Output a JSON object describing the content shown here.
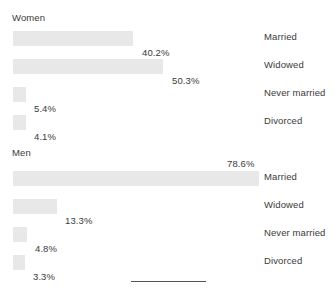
{
  "chart_data": {
    "type": "bar",
    "title": "",
    "xlabel": "",
    "ylabel": "",
    "orientation": "horizontal",
    "value_suffix": "%",
    "grid": false,
    "legend": "none",
    "categories": [
      "Married",
      "Widowed",
      "Never married",
      "Divorced"
    ],
    "panels": [
      {
        "name": "Women",
        "values": [
          40.2,
          50.3,
          5.4,
          4.1
        ],
        "labels": [
          "40.2%",
          "50.3%",
          "5.4%",
          "4.1%"
        ]
      },
      {
        "name": "Men",
        "values": [
          78.6,
          13.3,
          4.8,
          3.3
        ],
        "labels": [
          "78.6%",
          "13.3%",
          "4.8%",
          "3.3%"
        ]
      }
    ],
    "series": [
      {
        "name": "Women",
        "values": [
          40.2,
          50.3,
          5.4,
          4.1
        ]
      },
      {
        "name": "Men",
        "values": [
          78.6,
          13.3,
          4.8,
          3.3
        ]
      }
    ],
    "colors": {
      "bar_fill": "#e8e8e8",
      "text": "#3a3a3a",
      "background": "#ffffff",
      "rule": "#555555"
    }
  },
  "women": {
    "title": "Women",
    "rows": [
      {
        "label": "Married",
        "value": "40.2%",
        "bar_width": 120,
        "label_pos": "below",
        "label_left": 142,
        "row_top": 31
      },
      {
        "label": "Widowed",
        "value": "50.3%",
        "bar_width": 150,
        "label_left": 172,
        "label_pos": "below",
        "row_top": 59
      },
      {
        "label": "Never married",
        "value": "5.4%",
        "bar_width": 13,
        "label_left": 34,
        "label_pos": "below",
        "row_top": 87
      },
      {
        "label": "Divorced",
        "value": "4.1%",
        "bar_width": 13,
        "label_left": 34,
        "label_pos": "below",
        "row_top": 115
      }
    ]
  },
  "men": {
    "title": "Men",
    "rows": [
      {
        "label": "Married",
        "value": "78.6%",
        "bar_width": 246,
        "label_left": 227,
        "label_pos": "above",
        "row_top": 31
      },
      {
        "label": "Widowed",
        "value": "13.3%",
        "bar_width": 44,
        "label_left": 65,
        "label_pos": "below",
        "row_top": 59
      },
      {
        "label": "Never married",
        "value": "4.8%",
        "bar_width": 14,
        "label_left": 35,
        "label_pos": "below",
        "row_top": 87
      },
      {
        "label": "Divorced",
        "value": "3.3%",
        "bar_width": 12,
        "label_left": 33,
        "label_pos": "below",
        "row_top": 115
      }
    ]
  },
  "footer": {
    "rule_left": 131,
    "rule_top": 281,
    "rule_width": 75
  }
}
